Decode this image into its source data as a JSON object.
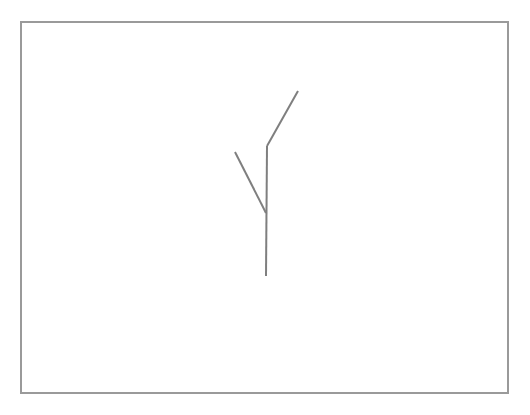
{
  "canvas": {
    "width": 530,
    "height": 415,
    "background_color": "#ffffff"
  },
  "frame": {
    "name": "drawing-border-frame",
    "x": 21,
    "y": 22,
    "width": 487,
    "height": 371,
    "stroke_color": "#9a9a9a",
    "stroke_width": 1.4,
    "fill": "none"
  },
  "drawing": {
    "title": "",
    "stroke_color": "#7f7f7f",
    "stroke_width": 2,
    "line_cap": "butt",
    "line_join": "miter",
    "strokes": [
      {
        "name": "upper-right-branch",
        "points": "298,91 267,146",
        "description": "diagonal segment descending from upper right to the top bend of the trunk"
      },
      {
        "name": "vertical-trunk",
        "points": "267,146 266,276",
        "description": "long near-vertical segment running down from the bend to the bottom tip"
      },
      {
        "name": "left-branch",
        "points": "235,152 266,213",
        "description": "diagonal segment descending from upper left and meeting the trunk"
      }
    ]
  },
  "text_content": {
    "visible_text": ""
  }
}
